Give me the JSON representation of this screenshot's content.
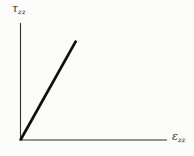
{
  "figure": {
    "background_color": "#fcfcfa",
    "axis_color": "#2f2f2f",
    "data_line_color": "#0e0e0e",
    "label_color": "#2a2a2a"
  },
  "chart_data": {
    "type": "line",
    "title": "",
    "xlabel": "ε_zz",
    "ylabel": "τ_zz",
    "xlabel_symbol": "ε",
    "xlabel_subscript": "zz",
    "ylabel_symbol": "τ",
    "ylabel_subscript": "zz",
    "x_range": [
      0,
      1
    ],
    "y_range": [
      0,
      1
    ],
    "grid": false,
    "legend": "none",
    "tick_labels": "none",
    "series": [
      {
        "name": "linear-elastic-response",
        "points": [
          [
            0,
            0
          ],
          [
            0.38,
            0.85
          ]
        ],
        "description": "straight line of constant positive slope starting at the origin"
      }
    ],
    "layout": {
      "origin_px": {
        "x": 20.5,
        "y": 140
      },
      "y_axis_top_px": 23,
      "x_axis_right_px": 167,
      "x_axis_left_overhang_px": 1.5,
      "axis_stroke_width": 1.1,
      "data_stroke_width": 2.7
    }
  }
}
